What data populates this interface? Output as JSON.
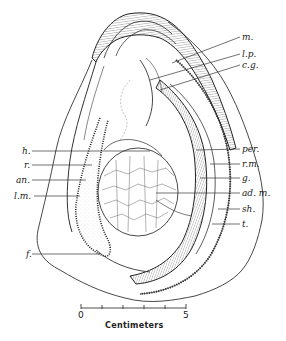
{
  "figure": {
    "labels_right": [
      {
        "key": "m",
        "text": "m.",
        "y": 35
      },
      {
        "key": "lp",
        "text": "l.p.",
        "y": 52
      },
      {
        "key": "cg",
        "text": "c.g.",
        "y": 63
      },
      {
        "key": "per",
        "text": "per.",
        "y": 147
      },
      {
        "key": "rm",
        "text": "r.m.",
        "y": 162
      },
      {
        "key": "g",
        "text": "g.",
        "y": 176
      },
      {
        "key": "adm",
        "text": "ad. m.",
        "y": 191
      },
      {
        "key": "sh",
        "text": "sh.",
        "y": 207
      },
      {
        "key": "t",
        "text": "t.",
        "y": 222
      }
    ],
    "labels_left": [
      {
        "key": "h",
        "text": "h.",
        "y": 149
      },
      {
        "key": "r",
        "text": "r.",
        "y": 163
      },
      {
        "key": "an",
        "text": "an.",
        "y": 178
      },
      {
        "key": "lm",
        "text": "l.m.",
        "y": 194
      },
      {
        "key": "f",
        "text": "f.",
        "y": 252
      }
    ]
  },
  "scale_bar": {
    "start_label": "0",
    "end_label": "5",
    "unit_label": "Centimeters",
    "ticks": [
      0,
      1,
      2,
      3,
      4,
      5
    ]
  }
}
